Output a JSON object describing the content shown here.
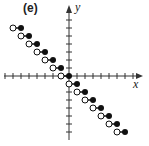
{
  "panel_label": "(e)",
  "axes": {
    "x_label": "x",
    "y_label": "y"
  },
  "colors": {
    "axis": "#333333",
    "filled": "#111111",
    "open_fill": "#ffffff"
  },
  "graph": {
    "type": "step_function",
    "description": "Greatest-integer style step function y = -[[x]]-like with open left endpoints and filled right endpoints",
    "steps": [
      {
        "x_open": -7,
        "x_closed": -6,
        "y": 6
      },
      {
        "x_open": -6,
        "x_closed": -5,
        "y": 5
      },
      {
        "x_open": -5,
        "x_closed": -4,
        "y": 4
      },
      {
        "x_open": -4,
        "x_closed": -3,
        "y": 3
      },
      {
        "x_open": -3,
        "x_closed": -2,
        "y": 2
      },
      {
        "x_open": -2,
        "x_closed": -1,
        "y": 1
      },
      {
        "x_open": -1,
        "x_closed": 0,
        "y": 0
      },
      {
        "x_open": 0,
        "x_closed": 1,
        "y": -1
      },
      {
        "x_open": 1,
        "x_closed": 2,
        "y": -2
      },
      {
        "x_open": 2,
        "x_closed": 3,
        "y": -3
      },
      {
        "x_open": 3,
        "x_closed": 4,
        "y": -4
      },
      {
        "x_open": 4,
        "x_closed": 5,
        "y": -5
      },
      {
        "x_open": 5,
        "x_closed": 6,
        "y": -6
      },
      {
        "x_open": 6,
        "x_closed": 7,
        "y": -7
      }
    ]
  }
}
